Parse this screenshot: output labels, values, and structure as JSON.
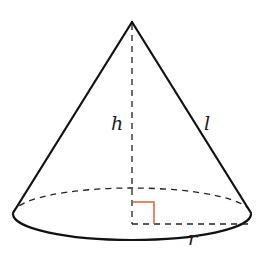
{
  "diagram": {
    "type": "right circular cone",
    "labels": {
      "height": "h",
      "slant_height": "l",
      "radius": "r"
    },
    "colors": {
      "stroke": "#111111",
      "right_angle_marker": "#e0603a",
      "background": "#ffffff"
    },
    "annotations": [
      "dashed vertical line from apex to base center (height h)",
      "slant edge from apex to base edge (slant height l)",
      "dashed radius from base center to right edge (radius r)",
      "right-angle marker at base center"
    ]
  }
}
